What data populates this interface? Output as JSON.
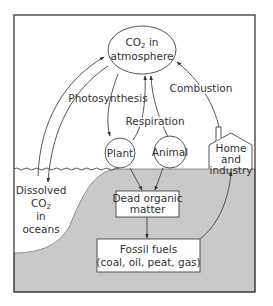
{
  "diagram": {
    "colors": {
      "frame": "#3a3a3a",
      "land": "#c9c9c9",
      "background": "#ffffff",
      "line": "#444444",
      "text": "#333333"
    },
    "nodes": {
      "atmosphere": {
        "line1_main": "CO",
        "line1_sub": "2",
        "line1_tail": " in",
        "line2": "atmosphere"
      },
      "plant": {
        "label": "Plant"
      },
      "animal": {
        "label": "Animal"
      },
      "home": {
        "line1": "Home",
        "line2": "and",
        "line3": "industry"
      },
      "oceans": {
        "line1": "Dissolved",
        "line2_main": "CO",
        "line2_sub": "2",
        "line3": "in",
        "line4": "oceans"
      },
      "dead_matter": {
        "line1": "Dead organic",
        "line2": "matter"
      },
      "fossil_fuels": {
        "line1": "Fossil fuels",
        "line2": "(coal, oil, peat, gas)"
      }
    },
    "processes": {
      "photosynthesis": "Photosynthesis",
      "respiration": "Respiration",
      "combustion": "Combustion"
    },
    "edges": [
      {
        "from": "oceans",
        "to": "atmosphere"
      },
      {
        "from": "atmosphere",
        "to": "oceans"
      },
      {
        "from": "atmosphere",
        "to": "plant",
        "label": "Photosynthesis"
      },
      {
        "from": "plant",
        "to": "atmosphere",
        "label": "Respiration"
      },
      {
        "from": "animal",
        "to": "atmosphere",
        "label": "Respiration"
      },
      {
        "from": "home",
        "to": "atmosphere",
        "label": "Combustion"
      },
      {
        "from": "plant",
        "to": "dead_matter"
      },
      {
        "from": "animal",
        "to": "dead_matter"
      },
      {
        "from": "dead_matter",
        "to": "fossil_fuels"
      },
      {
        "from": "fossil_fuels",
        "to": "home"
      }
    ]
  }
}
